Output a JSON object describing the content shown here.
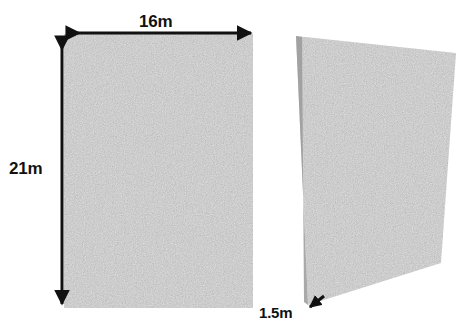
{
  "figure": {
    "background_color": "#ffffff",
    "fill_color": "#a8a8a8",
    "line_color": "#111111",
    "labels": {
      "width": "16m",
      "height": "21m",
      "depth": "1.5m"
    },
    "shapes": [
      {
        "name": "front-face-rectangle",
        "type": "rectangle",
        "points": "64,34 253,34 253,308 64,308"
      },
      {
        "name": "perspective-slab-face",
        "type": "quadrilateral",
        "points": "296,36 456,53 441,263 308,305"
      }
    ],
    "dimension_arrows": [
      {
        "name": "width-arrow",
        "orientation": "horizontal",
        "label": "16m",
        "from": "64,33",
        "to": "254,33",
        "heads": "both"
      },
      {
        "name": "height-arrow",
        "orientation": "vertical",
        "label": "21m",
        "from": "62,34",
        "to": "62,307",
        "heads": "both"
      },
      {
        "name": "depth-arrow",
        "orientation": "diagonal",
        "label": "1.5m",
        "from": "322,297",
        "to": "306,310",
        "heads": "end"
      }
    ]
  }
}
